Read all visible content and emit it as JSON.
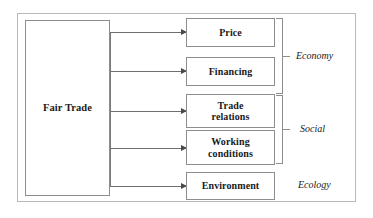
{
  "diagram": {
    "frame": {
      "border_color": "#b9b9b9"
    },
    "source_node": {
      "label": "Fair Trade"
    },
    "nodes": [
      {
        "id": "price",
        "label": "Price"
      },
      {
        "id": "financing",
        "label": "Financing"
      },
      {
        "id": "trade-relations",
        "label": "Trade\nrelations"
      },
      {
        "id": "working-conditions",
        "label": "Working\nconditions"
      },
      {
        "id": "environment",
        "label": "Environment"
      }
    ],
    "groups": [
      {
        "id": "economy",
        "label": "Economy",
        "members": [
          "price",
          "financing"
        ],
        "bracket": true
      },
      {
        "id": "social",
        "label": "Social",
        "members": [
          "trade-relations",
          "working-conditions"
        ],
        "bracket": true
      },
      {
        "id": "ecology",
        "label": "Ecology",
        "members": [
          "environment"
        ],
        "bracket": false
      }
    ],
    "connectors": {
      "style": "arrow",
      "count": 5,
      "color": "#6f6f6f"
    },
    "colors": {
      "box_border": "#8d8d8d",
      "frame_border": "#b9b9b9",
      "text": "#1a1a1a",
      "arrow": "#6f6f6f",
      "background": "#ffffff"
    }
  }
}
